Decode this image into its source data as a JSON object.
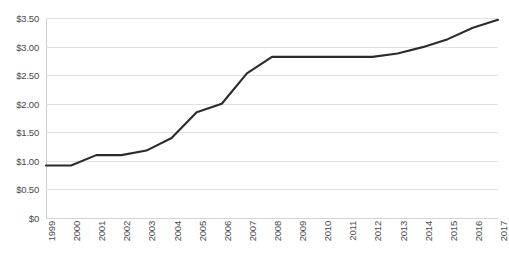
{
  "chart_data": {
    "type": "line",
    "title": "",
    "subtitle": "",
    "xlabel": "",
    "ylabel": "",
    "categories": [
      "1999",
      "2000",
      "2001",
      "2002",
      "2003",
      "2004",
      "2005",
      "2006",
      "2007",
      "2008",
      "2009",
      "2010",
      "2011",
      "2012",
      "2013",
      "2014",
      "2015",
      "2016",
      "2017"
    ],
    "values": [
      0.92,
      0.92,
      1.1,
      1.1,
      1.18,
      1.4,
      1.85,
      2.0,
      2.53,
      2.82,
      2.82,
      2.82,
      2.82,
      2.82,
      2.88,
      2.99,
      3.13,
      3.33,
      3.47
    ],
    "series": [
      {
        "name": "",
        "values": [
          0.92,
          0.92,
          1.1,
          1.1,
          1.18,
          1.4,
          1.85,
          2.0,
          2.53,
          2.82,
          2.82,
          2.82,
          2.82,
          2.82,
          2.88,
          2.99,
          3.13,
          3.33,
          3.47
        ]
      }
    ],
    "ylim": [
      0,
      3.5
    ],
    "yticks": [
      0,
      0.5,
      1.0,
      1.5,
      2.0,
      2.5,
      3.0,
      3.5
    ],
    "ytick_labels": [
      "$0",
      "$0.50",
      "$1.00",
      "$1.50",
      "$2.00",
      "$2.50",
      "$3.00",
      "$3.50"
    ],
    "grid": true,
    "legend": false,
    "legend_position": "none",
    "line_color": "#2b2b2b",
    "grid_color": "#e2e2e2",
    "background_color": "#ffffff",
    "text_color": "#4a4a4a"
  }
}
